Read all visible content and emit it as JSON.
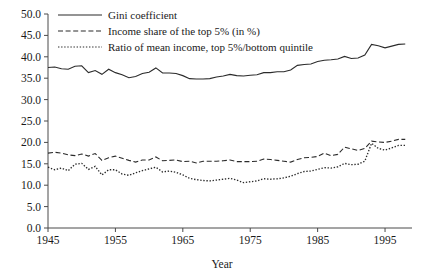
{
  "chart_data": {
    "type": "line",
    "title": "",
    "xlabel": "Year",
    "ylabel": "",
    "xlim": [
      1945,
      1999
    ],
    "ylim": [
      0.0,
      50.0
    ],
    "grid": false,
    "legend_position": "top-left-inside",
    "y_ticks": [
      "0.0",
      "5.0",
      "10.0",
      "15.0",
      "20.0",
      "25.0",
      "30.0",
      "35.0",
      "40.0",
      "45.0",
      "50.0"
    ],
    "y_tick_values": [
      0,
      5,
      10,
      15,
      20,
      25,
      30,
      35,
      40,
      45,
      50
    ],
    "x_ticks": [
      "1945",
      "1955",
      "1965",
      "1975",
      "1985",
      "1995"
    ],
    "x_tick_values": [
      1945,
      1955,
      1965,
      1975,
      1985,
      1995
    ],
    "x": [
      1945,
      1946,
      1947,
      1948,
      1949,
      1950,
      1951,
      1952,
      1953,
      1954,
      1955,
      1956,
      1957,
      1958,
      1959,
      1960,
      1961,
      1962,
      1963,
      1964,
      1965,
      1966,
      1967,
      1968,
      1969,
      1970,
      1971,
      1972,
      1973,
      1974,
      1975,
      1976,
      1977,
      1978,
      1979,
      1980,
      1981,
      1982,
      1983,
      1984,
      1985,
      1986,
      1987,
      1988,
      1989,
      1990,
      1991,
      1992,
      1993,
      1994,
      1995,
      1996,
      1997,
      1998
    ],
    "series": [
      {
        "name": "Gini coefficient",
        "style": "solid",
        "values": [
          37.5,
          37.6,
          37.2,
          37.1,
          37.8,
          37.9,
          36.3,
          36.8,
          35.9,
          37.1,
          36.3,
          35.8,
          35.1,
          35.4,
          36.1,
          36.4,
          37.4,
          36.2,
          36.2,
          36.1,
          35.6,
          34.9,
          34.8,
          34.8,
          34.9,
          35.3,
          35.5,
          35.9,
          35.6,
          35.5,
          35.7,
          35.8,
          36.3,
          36.3,
          36.5,
          36.5,
          36.9,
          38.0,
          38.2,
          38.3,
          38.9,
          39.2,
          39.3,
          39.5,
          40.1,
          39.6,
          39.7,
          40.4,
          42.9,
          42.6,
          42.1,
          42.5,
          42.9,
          43.0
        ]
      },
      {
        "name": "Income share of the top 5% (in %)",
        "style": "dashed",
        "values": [
          17.5,
          17.7,
          17.5,
          17.1,
          16.9,
          17.3,
          16.8,
          17.4,
          15.8,
          16.4,
          16.8,
          16.3,
          15.8,
          15.4,
          15.9,
          15.9,
          16.6,
          15.7,
          15.8,
          15.9,
          15.5,
          15.6,
          15.2,
          15.6,
          15.6,
          15.6,
          15.7,
          15.9,
          15.5,
          15.5,
          15.5,
          15.6,
          16.1,
          16.0,
          15.8,
          15.6,
          15.4,
          16.0,
          16.4,
          16.5,
          16.7,
          17.5,
          16.9,
          17.2,
          18.9,
          18.5,
          18.1,
          18.6,
          20.3,
          20.1,
          20.0,
          20.3,
          20.7,
          20.7
        ]
      },
      {
        "name": "Ratio of mean income, top 5%/bottom quintile",
        "style": "dotted",
        "values": [
          14.2,
          13.6,
          14.0,
          13.4,
          14.9,
          15.1,
          13.7,
          14.4,
          12.4,
          13.6,
          13.6,
          12.6,
          12.3,
          12.9,
          13.4,
          13.8,
          14.2,
          13.1,
          13.3,
          13.0,
          12.4,
          11.6,
          11.3,
          11.1,
          11.0,
          11.2,
          11.4,
          11.6,
          11.2,
          10.6,
          10.8,
          11.0,
          11.5,
          11.4,
          11.5,
          11.7,
          12.1,
          12.7,
          13.2,
          13.3,
          13.7,
          14.1,
          14.0,
          14.3,
          15.1,
          14.8,
          14.9,
          15.6,
          19.8,
          18.6,
          18.2,
          18.7,
          19.3,
          19.3
        ]
      }
    ]
  },
  "legend": {
    "items": [
      {
        "label": "Gini coefficient",
        "style": "solid"
      },
      {
        "label": "Income share of the top 5% (in %)",
        "style": "dashed"
      },
      {
        "label": "Ratio of mean income, top 5%/bottom quintile",
        "style": "dotted"
      }
    ]
  }
}
